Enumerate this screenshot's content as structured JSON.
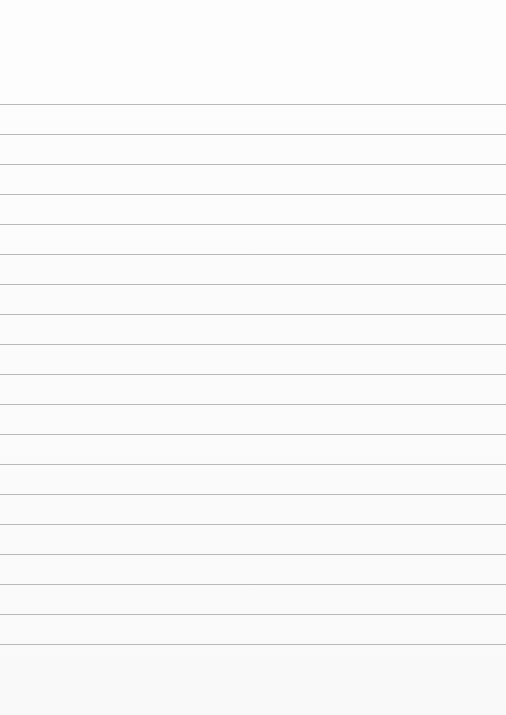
{
  "page": {
    "type": "lined-paper",
    "background_color": "#ffffff",
    "rule_color": "#b9b9b9",
    "first_rule_y": 104,
    "rule_spacing": 30,
    "rule_count": 19
  }
}
